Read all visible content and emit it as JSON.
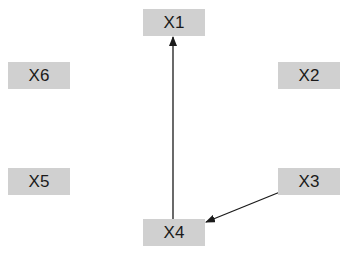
{
  "diagram": {
    "nodes": [
      {
        "id": "x1",
        "label": "X1"
      },
      {
        "id": "x2",
        "label": "X2"
      },
      {
        "id": "x3",
        "label": "X3"
      },
      {
        "id": "x4",
        "label": "X4"
      },
      {
        "id": "x5",
        "label": "X5"
      },
      {
        "id": "x6",
        "label": "X6"
      }
    ],
    "edges": [
      {
        "from": "x4",
        "to": "x1"
      },
      {
        "from": "x3",
        "to": "x4"
      }
    ],
    "colors": {
      "node_fill": "#d0d0d0",
      "edge": "#1a1a1a",
      "text": "#1a1a1a"
    }
  }
}
